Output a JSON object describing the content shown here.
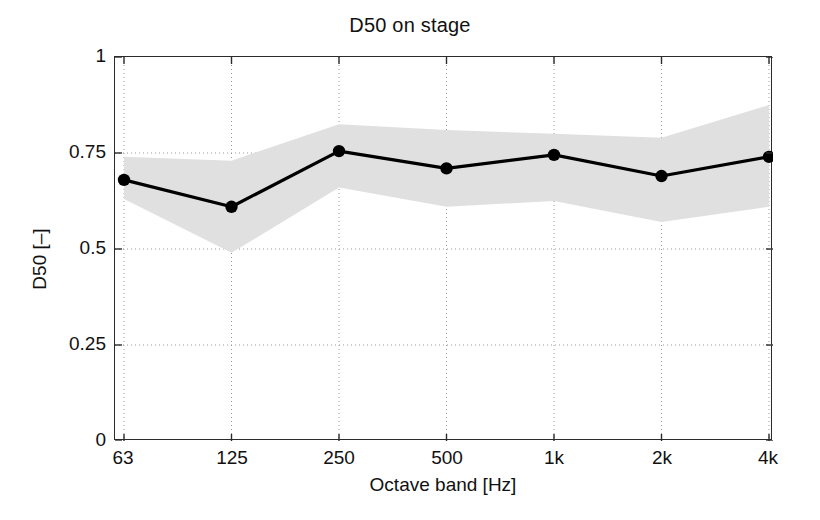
{
  "figure": {
    "title": "D50 on stage",
    "xlabel": "Octave band [Hz]",
    "ylabel": "D50 [–]"
  },
  "axes": {
    "yticks": [
      "0",
      "0.25",
      "0.5",
      "0.75",
      "1"
    ],
    "xticks": [
      "63",
      "125",
      "250",
      "500",
      "1k",
      "2k",
      "4k"
    ]
  },
  "colors": {
    "line": "#000000",
    "marker": "#000000",
    "band": "#e0e0e0",
    "axis": "#2b2b2b",
    "grid": "#9a9a9a",
    "background": "#ffffff"
  },
  "chart_data": {
    "type": "line",
    "title": "D50 on stage",
    "xlabel": "Octave band [Hz]",
    "ylabel": "D50 [–]",
    "categories": [
      "63",
      "125",
      "250",
      "500",
      "1k",
      "2k",
      "4k"
    ],
    "ylim": [
      0,
      1
    ],
    "yticks": [
      0,
      0.25,
      0.5,
      0.75,
      1
    ],
    "grid": true,
    "grid_style": "dotted",
    "legend": "none",
    "series": [
      {
        "name": "D50 mean",
        "marker": "filled-circle",
        "values": [
          0.68,
          0.61,
          0.755,
          0.71,
          0.745,
          0.69,
          0.74
        ]
      },
      {
        "name": "D50 spread (shaded band) upper",
        "values": [
          0.74,
          0.73,
          0.825,
          0.81,
          0.8,
          0.79,
          0.875
        ]
      },
      {
        "name": "D50 spread (shaded band) lower",
        "values": [
          0.63,
          0.49,
          0.66,
          0.61,
          0.625,
          0.57,
          0.61
        ]
      }
    ]
  }
}
